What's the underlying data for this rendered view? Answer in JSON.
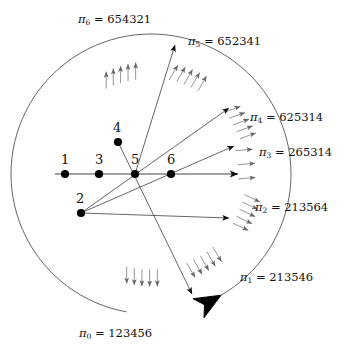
{
  "figure": {
    "type": "diagram",
    "background_color": "#ffffff",
    "line_color": "#555555",
    "axis_color": "#444444",
    "point_color": "#000000",
    "text_color": "#111111",
    "width": 348,
    "height": 350
  },
  "points": [
    {
      "id": "p1",
      "label": "1",
      "x": 65,
      "y": 174,
      "label_x": 61,
      "label_y": 153
    },
    {
      "id": "p2",
      "label": "2",
      "x": 81,
      "y": 213,
      "label_x": 76,
      "label_y": 192
    },
    {
      "id": "p3",
      "label": "3",
      "x": 99,
      "y": 174,
      "label_x": 95,
      "label_y": 153
    },
    {
      "id": "p4",
      "label": "4",
      "x": 118,
      "y": 142,
      "label_x": 113,
      "label_y": 121
    },
    {
      "id": "p5",
      "label": "5",
      "x": 135,
      "y": 174,
      "label_x": 131,
      "label_y": 153
    },
    {
      "id": "p6",
      "label": "6",
      "x": 171,
      "y": 174,
      "label_x": 167,
      "label_y": 153
    }
  ],
  "permutations": [
    {
      "id": "pi0",
      "symbol": "π",
      "index": "0",
      "value": "123456",
      "text": "π₀ = 123456",
      "label_x": 79,
      "label_y": 328,
      "anchor": "start"
    },
    {
      "id": "pi1",
      "symbol": "π",
      "index": "1",
      "value": "213546",
      "text": "π₁ = 213546",
      "label_x": 240,
      "label_y": 272,
      "anchor": "start"
    },
    {
      "id": "pi2",
      "symbol": "π",
      "index": "2",
      "value": "213564",
      "text": "π₂ = 213564",
      "label_x": 255,
      "label_y": 202,
      "anchor": "start"
    },
    {
      "id": "pi3",
      "symbol": "π",
      "index": "3",
      "value": "265314",
      "text": "π₃ = 265314",
      "label_x": 259,
      "label_y": 147,
      "anchor": "start"
    },
    {
      "id": "pi4",
      "symbol": "π",
      "index": "4",
      "value": "625314",
      "text": "π₄ = 625314",
      "label_x": 250,
      "label_y": 112,
      "anchor": "start"
    },
    {
      "id": "pi5",
      "symbol": "π",
      "index": "5",
      "value": "652341",
      "text": "π₅ = 652341",
      "label_x": 188,
      "label_y": 36,
      "anchor": "start"
    },
    {
      "id": "pi6",
      "symbol": "π",
      "index": "6",
      "value": "654321",
      "text": "π₆ = 654321",
      "label_x": 78,
      "label_y": 14,
      "anchor": "start"
    }
  ],
  "baseline": {
    "name": "horizontal-axis",
    "x1": 55,
    "y1": 174,
    "x2": 238,
    "y2": 174,
    "arrow": true
  },
  "rays": [
    {
      "id": "ray-a",
      "from": "p5",
      "x1": 135,
      "y1": 174,
      "x2": 175,
      "y2": 45,
      "arrow": true
    },
    {
      "id": "ray-b",
      "from": "p2",
      "x1": 81,
      "y1": 213,
      "x2": 229,
      "y2": 108,
      "arrow": true
    },
    {
      "id": "ray-c",
      "from": "p2",
      "x1": 81,
      "y1": 213,
      "x2": 234,
      "y2": 146,
      "arrow": true
    },
    {
      "id": "ray-d",
      "from": "p2",
      "x1": 81,
      "y1": 213,
      "x2": 229,
      "y2": 218,
      "arrow": true
    },
    {
      "id": "ray-e",
      "from": "p4",
      "x1": 118,
      "y1": 142,
      "x2": 192,
      "y2": 294,
      "arrow": true
    }
  ],
  "arc": {
    "name": "outer-arc",
    "cx": 151,
    "cy": 174,
    "r": 140,
    "start_deg": 100,
    "sweep_deg": 320,
    "arrow": true,
    "arrow_label": "counterclockwise-sweep"
  },
  "arrow_clusters": [
    {
      "id": "cluster-pi6",
      "sector": "pi6",
      "count": 5,
      "direction_deg": 270,
      "note": "up"
    },
    {
      "id": "cluster-pi5",
      "sector": "pi5",
      "count": 5,
      "direction_deg": 300,
      "note": "up-right"
    },
    {
      "id": "cluster-pi4",
      "sector": "pi4",
      "count": 5,
      "direction_deg": 340,
      "note": "right-up"
    },
    {
      "id": "cluster-pi3",
      "sector": "pi3",
      "count": 3,
      "direction_deg": 355,
      "note": "right"
    },
    {
      "id": "cluster-pi2",
      "sector": "pi2",
      "count": 5,
      "direction_deg": 25,
      "note": "right-down"
    },
    {
      "id": "cluster-pi1",
      "sector": "pi1",
      "count": 5,
      "direction_deg": 60,
      "note": "down-right"
    },
    {
      "id": "cluster-pi0",
      "sector": "pi0",
      "count": 5,
      "direction_deg": 90,
      "note": "down"
    }
  ]
}
